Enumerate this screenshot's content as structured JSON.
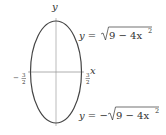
{
  "diagram": {
    "type": "ellipse-graph",
    "axes": {
      "x_label": "y",
      "x_axis_label": "x",
      "y_axis_label": "y"
    },
    "ticks": {
      "left": {
        "sign": "−",
        "num": "3",
        "den": "2"
      },
      "right": {
        "num": "3",
        "den": "2"
      }
    },
    "equations": {
      "top": {
        "lhs": "y =",
        "radicand": "9 − 4x",
        "exp": "2"
      },
      "bottom": {
        "lhs": "y = −",
        "radicand": "9 − 4x",
        "exp": "2"
      }
    },
    "colors": {
      "curve": "#444444",
      "axis": "#999999",
      "text": "#333333"
    }
  }
}
